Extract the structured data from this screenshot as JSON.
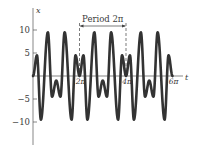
{
  "chart_data": {
    "type": "line",
    "title": "",
    "xlabel": "t",
    "ylabel": "x",
    "xlim": [
      0,
      18.85
    ],
    "ylim": [
      -14,
      15
    ],
    "grid": false,
    "legend": null,
    "y_ticks": [
      {
        "value": 10,
        "label": "10"
      },
      {
        "value": 5,
        "label": "5"
      },
      {
        "value": -5,
        "label": "−5"
      },
      {
        "value": -10,
        "label": "−10"
      }
    ],
    "x_ticks": [
      {
        "value": 6.2832,
        "label": "2π"
      },
      {
        "value": 12.5664,
        "label": "4π"
      },
      {
        "value": 18.8496,
        "label": "6π"
      }
    ],
    "annotation": {
      "text": "Period 2π",
      "from": 6.2832,
      "to": 12.5664
    },
    "period": 6.2832,
    "periods_shown": 3,
    "one_period_extrema": {
      "t_fraction_of_period": [
        0.0,
        0.085,
        0.17,
        0.32,
        0.41,
        0.5,
        0.59,
        0.68,
        0.83,
        0.915,
        1.0
      ],
      "x": [
        0,
        4.5,
        -9.5,
        9.5,
        -4.5,
        -1,
        -4.5,
        9.5,
        -9.5,
        4.5,
        0
      ]
    },
    "series": [
      {
        "name": "x(t)",
        "color": "#333333",
        "line_width": 2.6
      }
    ]
  },
  "labels": {
    "y_axis": "x",
    "x_axis": "t",
    "period": "Period 2π"
  }
}
